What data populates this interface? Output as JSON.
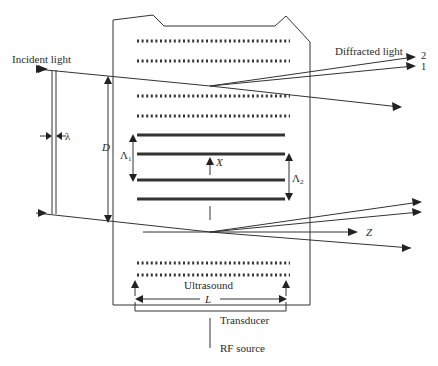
{
  "diagram": {
    "labels": {
      "incident_light": "Incident light",
      "diffracted_light": "Diffracted light",
      "order_2": "2",
      "order_1": "1",
      "wavelength": "λ",
      "beam_width": "D",
      "period_1": "Λ",
      "period_1_sub": "1",
      "period_2": "Λ",
      "period_2_sub": "2",
      "axis_x": "X",
      "axis_z": "Z",
      "ultrasound": "Ultrasound",
      "length": "L",
      "transducer": "Transducer",
      "rf_source": "RF source"
    },
    "colors": {
      "line": "#333333",
      "text": "#2a2a2a",
      "background": "#ffffff"
    }
  }
}
